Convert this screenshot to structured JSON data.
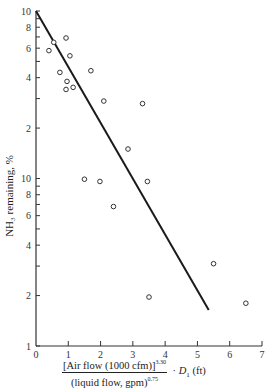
{
  "chart_data": {
    "type": "scatter",
    "title": "",
    "xlabel": "[Air flow (1000 cfm)]^3.30 / (liquid flow, gpm)^0.75 · D1 (ft)",
    "ylabel": "NH3 remaining, %",
    "x_scale": "linear",
    "y_scale": "log",
    "xlim": [
      0,
      7
    ],
    "ylim": [
      1,
      100
    ],
    "x_ticks": [
      0,
      1,
      2,
      3,
      4,
      5,
      6,
      7
    ],
    "y_ticks": [
      {
        "value": 1,
        "label": "1"
      },
      {
        "value": 2,
        "label": "2"
      },
      {
        "value": 4,
        "label": "4"
      },
      {
        "value": 6,
        "label": "6"
      },
      {
        "value": 8,
        "label": "8"
      },
      {
        "value": 10,
        "label": "10"
      },
      {
        "value": 20,
        "label": "2"
      },
      {
        "value": 40,
        "label": "4"
      },
      {
        "value": 60,
        "label": "6"
      },
      {
        "value": 80,
        "label": "8"
      },
      {
        "value": 100,
        "label": "10"
      }
    ],
    "y_minor_ticks": [
      3,
      5,
      7,
      9,
      30,
      50,
      70,
      90
    ],
    "grid": false,
    "legend": null,
    "series": [
      {
        "name": "Data points",
        "marker": "open-circle",
        "points": [
          {
            "x": 0.4,
            "y": 58
          },
          {
            "x": 0.55,
            "y": 65
          },
          {
            "x": 0.74,
            "y": 43
          },
          {
            "x": 0.93,
            "y": 69
          },
          {
            "x": 0.96,
            "y": 38
          },
          {
            "x": 0.93,
            "y": 34
          },
          {
            "x": 1.05,
            "y": 54
          },
          {
            "x": 1.15,
            "y": 35
          },
          {
            "x": 1.7,
            "y": 44
          },
          {
            "x": 2.1,
            "y": 29
          },
          {
            "x": 3.3,
            "y": 28
          },
          {
            "x": 2.85,
            "y": 15
          },
          {
            "x": 1.5,
            "y": 9.9
          },
          {
            "x": 1.98,
            "y": 9.6
          },
          {
            "x": 2.4,
            "y": 6.8
          },
          {
            "x": 3.45,
            "y": 9.6
          },
          {
            "x": 5.5,
            "y": 3.1
          },
          {
            "x": 3.5,
            "y": 1.96
          },
          {
            "x": 6.5,
            "y": 1.8
          }
        ]
      },
      {
        "name": "Fit line",
        "type": "line",
        "points": [
          {
            "x": 0,
            "y": 100
          },
          {
            "x": 5.35,
            "y": 1.64
          }
        ]
      }
    ]
  },
  "axis_text": {
    "ylabel": "NH₃ remaining, %",
    "x_num": "[Air flow (1000 cfm)]",
    "x_num_exp": "3.30",
    "x_den": "(liquid flow, gpm)",
    "x_den_exp": "0.75",
    "x_mult": "· ",
    "x_D": "D",
    "x_D_sub": "1",
    "x_unit": " (ft)"
  }
}
